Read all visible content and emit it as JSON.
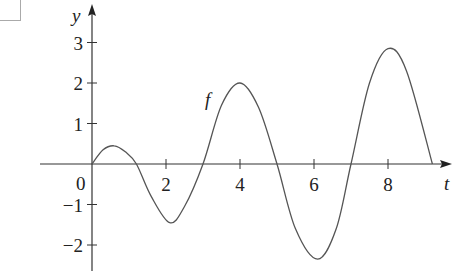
{
  "chart_data": {
    "type": "line",
    "title": "",
    "xlabel": "t",
    "ylabel": "y",
    "curve_label": "f",
    "xlim": [
      -1.3,
      9.9
    ],
    "ylim": [
      -2.6,
      3.5
    ],
    "x_ticks": [
      2,
      4,
      6,
      8
    ],
    "x_tick_labels": [
      "2",
      "4",
      "6",
      "8"
    ],
    "y_ticks": [
      3,
      2,
      1,
      -1,
      -2
    ],
    "y_tick_labels": [
      "3",
      "2",
      "1",
      "−1",
      "−2"
    ],
    "origin_label": "0",
    "grid": false,
    "legend": null,
    "series": [
      {
        "name": "f",
        "x": [
          0,
          0.3,
          0.6,
          0.9,
          1.2,
          1.6,
          2.1,
          2.5,
          3.0,
          3.5,
          4.0,
          4.5,
          5.0,
          5.5,
          6.1,
          6.6,
          7.0,
          7.5,
          8.0,
          8.5,
          9.2
        ],
        "values": [
          0,
          0.35,
          0.45,
          0.3,
          0,
          -0.8,
          -1.45,
          -1.05,
          0,
          1.45,
          2.0,
          1.4,
          0,
          -1.6,
          -2.35,
          -1.6,
          0,
          2.0,
          2.85,
          2.3,
          0
        ]
      }
    ]
  }
}
